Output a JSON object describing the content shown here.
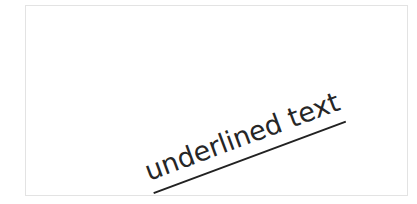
{
  "figure": {
    "background_color": "#ffffff",
    "frame": {
      "border_color": "#cfcfcf",
      "fill_color": "#ffffff"
    },
    "content": {
      "text": "underlined text",
      "decoration": "underline",
      "text_color": "#262626",
      "underline_color": "#222222",
      "rotation_degrees": "-20.4"
    }
  }
}
